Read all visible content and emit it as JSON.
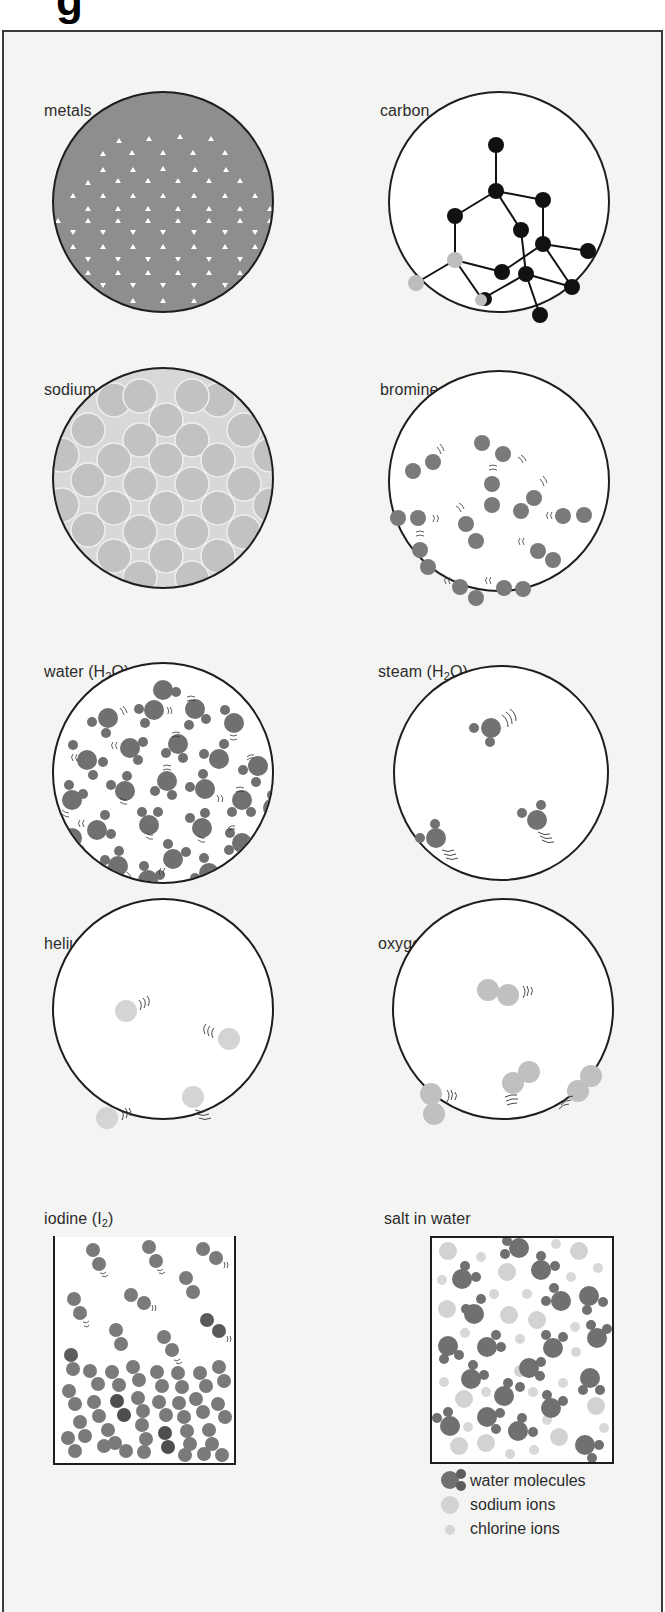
{
  "page": {
    "title_fragment": "g"
  },
  "panels": [
    {
      "id": "metals",
      "label": "metals",
      "shape": "circle",
      "fill": "#8c8c8c",
      "pattern": "lattice of white triangles (metal ions in electron sea)"
    },
    {
      "id": "carbon",
      "label": "carbon",
      "shape": "circle",
      "fill": "#ffffff",
      "pattern": "diamond covalent network, black atoms with bonds, some grey atoms"
    },
    {
      "id": "sodium-chloride",
      "label_main": "sodium chloride (NaC",
      "label_rest": "l)",
      "label": "sodium chloride (NaCl)",
      "shape": "circle",
      "fill": "#c8c8c8",
      "pattern": "close-packed ionic lattice"
    },
    {
      "id": "bromine",
      "label_main": "bromine (Br",
      "label_sub": "2",
      "label_end": ")",
      "shape": "circle",
      "fill": "#ffffff",
      "pattern": "diatomic molecules with motion lines"
    },
    {
      "id": "water",
      "label_main": "water (H",
      "label_sub": "2",
      "label_end": "O)",
      "shape": "circle",
      "fill": "#ffffff",
      "pattern": "densely packed H2O molecules"
    },
    {
      "id": "steam",
      "label_main": "steam (H",
      "label_sub": "2",
      "label_end": "O)",
      "shape": "circle",
      "fill": "#ffffff",
      "pattern": "3 widely spaced H2O molecules"
    },
    {
      "id": "helium",
      "label": "helium (He)",
      "shape": "circle",
      "fill": "#ffffff",
      "pattern": "4 single atoms with motion lines"
    },
    {
      "id": "oxygen",
      "label_main": "oxygen(O",
      "label_sub": "2",
      "label_end": ")",
      "shape": "circle",
      "fill": "#ffffff",
      "pattern": "4 diatomic molecules with motion lines"
    },
    {
      "id": "iodine",
      "label_main": "iodine (I",
      "label_sub": "2",
      "label_end": ")",
      "shape": "open-top box",
      "fill": "#ffffff",
      "pattern": "solid I2 at bottom, vapour molecules above"
    },
    {
      "id": "salt-in-water",
      "label": "salt in water",
      "shape": "box",
      "fill": "#ffffff",
      "pattern": "water molecules, sodium ions, chlorine ions"
    }
  ],
  "legend": {
    "items": [
      {
        "label": "water molecules",
        "symbol": "water-molecule"
      },
      {
        "label": "sodium ions",
        "symbol": "large-light-circle"
      },
      {
        "label": "chlorine ions",
        "symbol": "small-light-circle"
      }
    ]
  },
  "colors": {
    "frame_bg": "#f4f4f3",
    "outline": "#1e1e1e",
    "dark_particle": "#6e6e6e",
    "mid_particle": "#8a8a8a",
    "light_particle": "#cfcfcf",
    "carbon_atom": "#111111"
  }
}
